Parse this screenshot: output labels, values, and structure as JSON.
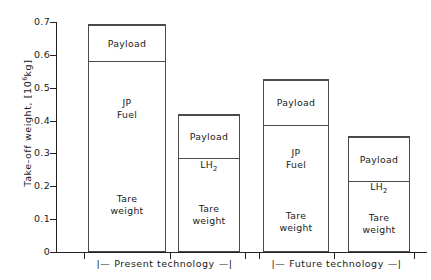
{
  "chart_data": {
    "type": "bar",
    "subtype": "stacked",
    "title": "",
    "xlabel": "",
    "ylabel": "Take-off weight, [10⁶kg]",
    "ylabel_text": "Take-off weight, [10",
    "ylabel_exponent": "6",
    "ylabel_tail": "kg]",
    "ylim": [
      0,
      0.7
    ],
    "ytick_labels": [
      "0",
      "0.1",
      "0.2",
      "0.3",
      "0.4",
      "0.5",
      "0.6",
      "0.7"
    ],
    "ytick_values": [
      0,
      0.1,
      0.2,
      0.3,
      0.4,
      0.5,
      0.6,
      0.7
    ],
    "grid": false,
    "legend": "none",
    "categories": [
      "JP fuel, present technology",
      "LH2, present technology",
      "JP fuel, future technology",
      "LH2, future technology"
    ],
    "series": [
      {
        "name": "Tare weight",
        "values": [
          0.295,
          0.234,
          0.188,
          0.176
        ]
      },
      {
        "name": "JP Fuel",
        "values": [
          0.288,
          null,
          0.201,
          null
        ]
      },
      {
        "name": "LH2",
        "values": [
          null,
          0.056,
          null,
          0.043
        ]
      },
      {
        "name": "Payload",
        "values": [
          0.112,
          0.13,
          0.139,
          0.134
        ]
      }
    ],
    "bar_totals": [
      0.695,
      0.42,
      0.528,
      0.353
    ],
    "bars": [
      {
        "name": "bar-1",
        "total": 0.695,
        "left_px": 88,
        "width_px": 78,
        "segments": [
          {
            "name": "tare-weight",
            "label": "Tare\nweight",
            "from": 0.0,
            "to": 0.295
          },
          {
            "name": "jp-fuel",
            "label": "JP\nFuel",
            "from": 0.295,
            "to": 0.583
          },
          {
            "name": "payload",
            "label": "Payload",
            "from": 0.583,
            "to": 0.695
          }
        ]
      },
      {
        "name": "bar-2",
        "total": 0.42,
        "left_px": 178,
        "width_px": 62,
        "segments": [
          {
            "name": "tare-weight",
            "label": "Tare\nweight",
            "from": 0.0,
            "to": 0.234
          },
          {
            "name": "lh2",
            "label": "LH2",
            "from": 0.234,
            "to": 0.29
          },
          {
            "name": "payload",
            "label": "Payload",
            "from": 0.29,
            "to": 0.42
          }
        ]
      },
      {
        "name": "bar-3",
        "total": 0.528,
        "left_px": 263,
        "width_px": 66,
        "segments": [
          {
            "name": "tare-weight",
            "label": "Tare\nweight",
            "from": 0.0,
            "to": 0.188
          },
          {
            "name": "jp-fuel",
            "label": "JP\nFuel",
            "from": 0.188,
            "to": 0.389
          },
          {
            "name": "payload",
            "label": "Payload",
            "from": 0.389,
            "to": 0.528
          }
        ]
      },
      {
        "name": "bar-4",
        "total": 0.353,
        "left_px": 348,
        "width_px": 62,
        "segments": [
          {
            "name": "tare-weight",
            "label": "Tare\nweight",
            "from": 0.0,
            "to": 0.176
          },
          {
            "name": "lh2",
            "label": "LH2",
            "from": 0.176,
            "to": 0.219
          },
          {
            "name": "payload",
            "label": "Payload",
            "from": 0.219,
            "to": 0.353
          }
        ]
      }
    ],
    "x_tick_positions_px": [
      84,
      170,
      245,
      259,
      334,
      414
    ],
    "groups": [
      {
        "name": "present-technology",
        "label": "Present  technology",
        "bracket_left": "|—",
        "bracket_right": "—|",
        "left_px": 84,
        "right_px": 245
      },
      {
        "name": "future-technology",
        "label": "Future  technology",
        "bracket_left": "|—",
        "bracket_right": "—|",
        "left_px": 259,
        "right_px": 414
      }
    ],
    "axis_color": "#222222",
    "bar_border_color": "#4a4a4a",
    "bar_fill_color": "#ffffff",
    "text_color": "#1a1a1a"
  }
}
